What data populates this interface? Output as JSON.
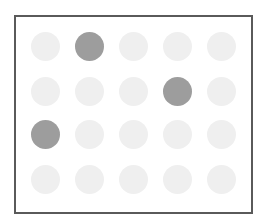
{
  "board": {
    "rows": 4,
    "cols": 5,
    "colors": {
      "active": "#9d9d9d",
      "inactive": "#efefef",
      "border": "#5a5a5a"
    },
    "cells": [
      [
        0,
        1,
        0,
        0,
        0
      ],
      [
        0,
        0,
        0,
        1,
        0
      ],
      [
        1,
        0,
        0,
        0,
        0
      ],
      [
        0,
        0,
        0,
        0,
        0
      ]
    ]
  }
}
